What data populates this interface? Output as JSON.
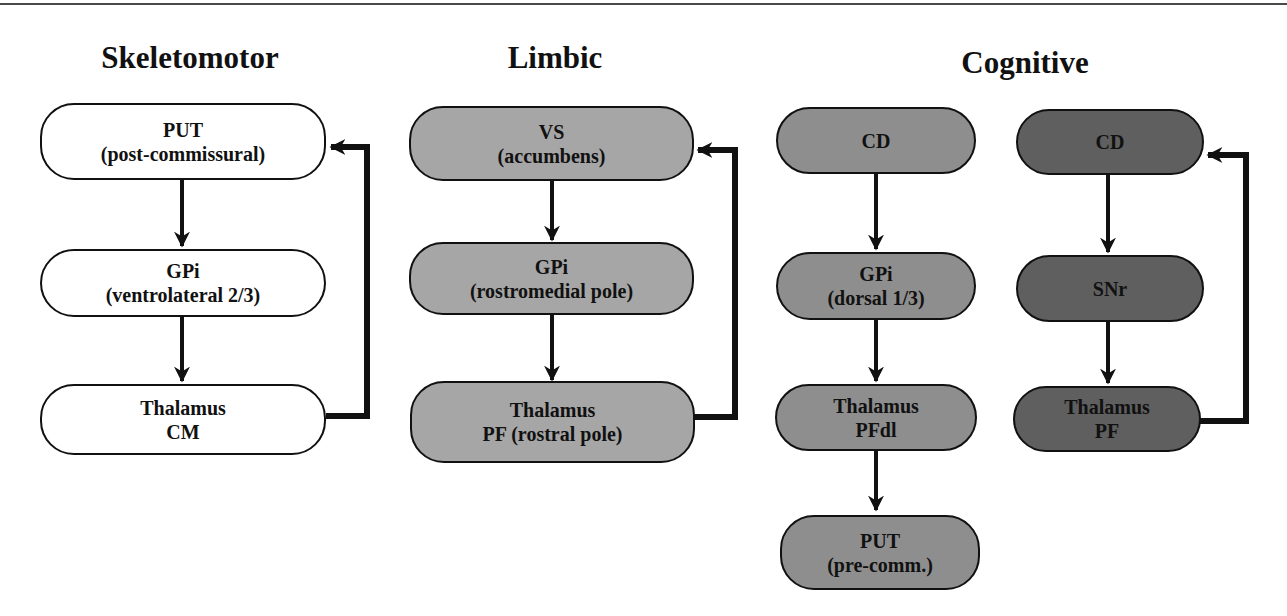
{
  "figure": {
    "columns": [
      {
        "title": "Skeletomotor",
        "fill": "#ffffff",
        "nodes": [
          {
            "line1": "PUT",
            "line2": "(post-commissural)"
          },
          {
            "line1": "GPi",
            "line2": "(ventrolateral 2/3)"
          },
          {
            "line1": "Thalamus",
            "line2": "CM"
          }
        ]
      },
      {
        "title": "Limbic",
        "fill": "#a6a6a6",
        "nodes": [
          {
            "line1": "VS",
            "line2": "(accumbens)"
          },
          {
            "line1": "GPi",
            "line2": "(rostromedial pole)"
          },
          {
            "line1": "Thalamus",
            "line2": "PF (rostral pole)"
          }
        ]
      },
      {
        "title": "Cognitive",
        "branches": [
          {
            "fill": "#8e8e8e",
            "nodes": [
              {
                "line1": "CD",
                "line2": ""
              },
              {
                "line1": "GPi",
                "line2": "(dorsal 1/3)"
              },
              {
                "line1": "Thalamus",
                "line2": "PFdl"
              },
              {
                "line1": "PUT",
                "line2": "(pre-comm.)"
              }
            ]
          },
          {
            "fill": "#5f5f5f",
            "nodes": [
              {
                "line1": "CD",
                "line2": ""
              },
              {
                "line1": "SNr",
                "line2": ""
              },
              {
                "line1": "Thalamus",
                "line2": "PF"
              }
            ]
          }
        ]
      }
    ]
  }
}
